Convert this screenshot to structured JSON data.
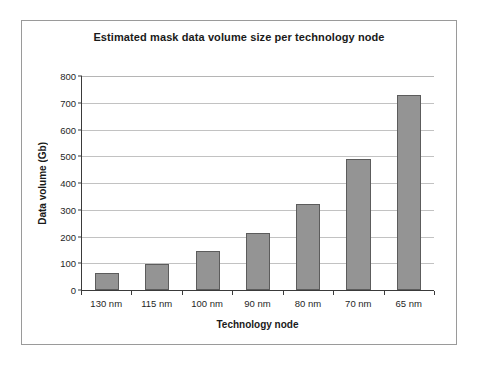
{
  "chart_data": {
    "type": "bar",
    "title": "Estimated mask data volume size per technology node",
    "xlabel": "Technology node",
    "ylabel": "Data volume (Gb)",
    "categories": [
      "130 nm",
      "115 nm",
      "100 nm",
      "90 nm",
      "80 nm",
      "70 nm",
      "65 nm"
    ],
    "values": [
      63,
      97,
      145,
      215,
      323,
      490,
      730
    ],
    "ylim": [
      0,
      800
    ],
    "ytick_labels": [
      "800",
      "700",
      "600",
      "500",
      "400",
      "300",
      "200",
      "100",
      "0"
    ],
    "ytick_values": [
      800,
      700,
      600,
      500,
      400,
      300,
      200,
      100,
      0
    ],
    "ytick_step": 100,
    "grid": true,
    "legend": false,
    "series": [
      {
        "name": "Data volume (Gb)",
        "values": [
          63,
          97,
          145,
          215,
          323,
          490,
          730
        ]
      }
    ],
    "colors": {
      "bar_fill": "#949494",
      "bar_border": "#5c5c5c",
      "gridline": "#c2c2c2",
      "axis": "#3a3a3a",
      "frame_border": "#9a9a9a",
      "background": "#ffffff",
      "text": "#1a1a1a"
    }
  }
}
